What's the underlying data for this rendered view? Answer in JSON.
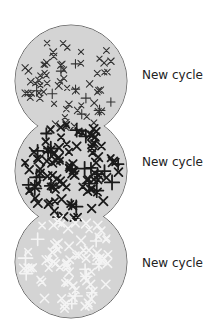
{
  "diagram": {
    "stages": [
      {
        "id": "stage-1",
        "label": "New cycle",
        "fill": "#d4d4d4",
        "mark_color": "#333333",
        "description": "sparse dark crosses",
        "cx": 71,
        "cy": 81,
        "r": 56
      },
      {
        "id": "stage-2",
        "label": "New cycle",
        "fill": "#d4d4d4",
        "mark_color": "#1a1a1a",
        "description": "dense bold crosses",
        "cx": 71,
        "cy": 171,
        "r": 56
      },
      {
        "id": "stage-3",
        "label": "New cycle",
        "fill": "#d4d4d4",
        "mark_color": "#f4f4f4",
        "description": "faded white crosses",
        "cx": 71,
        "cy": 262,
        "r": 56
      }
    ],
    "outline_color": "#666666"
  }
}
